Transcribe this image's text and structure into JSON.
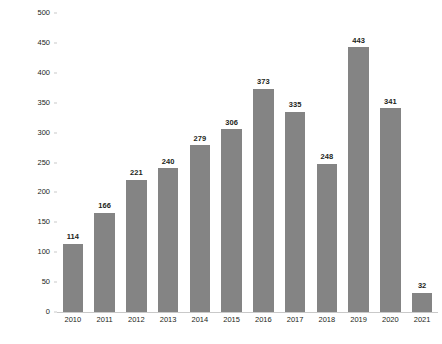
{
  "chart_data": {
    "type": "bar",
    "title": "",
    "subtitle": "",
    "xlabel": "",
    "ylabel": "Number of Records",
    "categories": [
      "2010",
      "2011",
      "2012",
      "2013",
      "2014",
      "2015",
      "2016",
      "2017",
      "2018",
      "2019",
      "2020",
      "2021"
    ],
    "values": [
      114,
      166,
      221,
      240,
      279,
      306,
      373,
      335,
      248,
      443,
      341,
      32
    ],
    "value_labels": [
      "114",
      "166",
      "221",
      "240",
      "279",
      "306",
      "373",
      "335",
      "248",
      "443",
      "341",
      "32"
    ],
    "ylim": [
      0,
      500
    ],
    "ytick_labels": [
      "500",
      "450",
      "400",
      "350",
      "300",
      "250",
      "200",
      "150",
      "100",
      "50",
      "0"
    ],
    "ytick_values": [
      500,
      450,
      400,
      350,
      300,
      250,
      200,
      150,
      100,
      50,
      0
    ],
    "grid": false,
    "legend": "none",
    "bar_color": "#848484",
    "axis_color": "#c9c9c9",
    "text_color": "#231f20",
    "background_color": "#ffffff"
  }
}
